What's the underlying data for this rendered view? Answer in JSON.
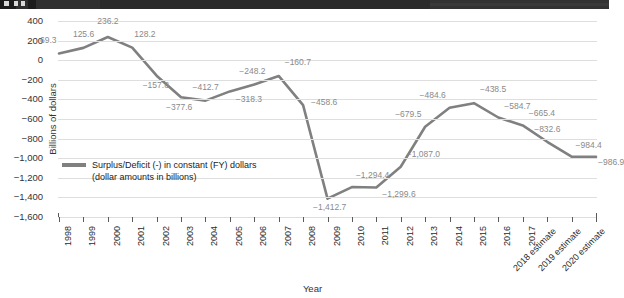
{
  "chrome": {
    "present": true,
    "color": "#2b2b2b"
  },
  "chart_data": {
    "type": "line",
    "title": "",
    "xlabel": "Year",
    "ylabel": "Billions of dollars",
    "ylim": [
      -1600,
      400
    ],
    "ytick_step": 200,
    "grid": true,
    "legend_position": "inside-lower-left",
    "accent_color": "#808080",
    "gridline_color": "#dedede",
    "label_color": "#8a8a8a",
    "yticks": [
      "400",
      "200",
      "0",
      "−200",
      "−400",
      "−600",
      "−800",
      "−1,000",
      "−1,200",
      "−1,400",
      "−1,600"
    ],
    "categories": [
      "1998",
      "1999",
      "2000",
      "2001",
      "2002",
      "2003",
      "2004",
      "2005",
      "2006",
      "2007",
      "2008",
      "2009",
      "2010",
      "2011",
      "2012",
      "2013",
      "2014",
      "2015",
      "2016",
      "2017",
      "2018 estimate",
      "2019 estimate",
      "2020 estimate"
    ],
    "series": [
      {
        "name": "Surplus/Deficit (-) in constant (FY) dollars",
        "values": [
          69.3,
          125.6,
          236.2,
          128.2,
          -157.8,
          -377.6,
          -412.7,
          -318.3,
          -248.2,
          -160.7,
          -458.6,
          -1412.7,
          -1294.4,
          -1299.6,
          -1087.0,
          -679.5,
          -484.6,
          -438.5,
          -584.7,
          -665.4,
          -832.6,
          -984.4,
          -986.9
        ],
        "labels": [
          "69.3",
          "125.6",
          "236.2",
          "128.2",
          "−157.8",
          "−377.6",
          "−412.7",
          "−318.3",
          "−248.2",
          "−160.7",
          "−458.6",
          "−1,412.7",
          "−1,294.4",
          "−1,299.6",
          "−1,087.0",
          "−679.5",
          "−484.6",
          "−438.5",
          "−584.7",
          "−665.4",
          "−832.6",
          "−984.4",
          "−986.9"
        ]
      }
    ]
  },
  "legend": {
    "line1": "Surplus/Deficit (-) in constant (FY) dollars",
    "line2": "(dollar amounts in billions)"
  }
}
